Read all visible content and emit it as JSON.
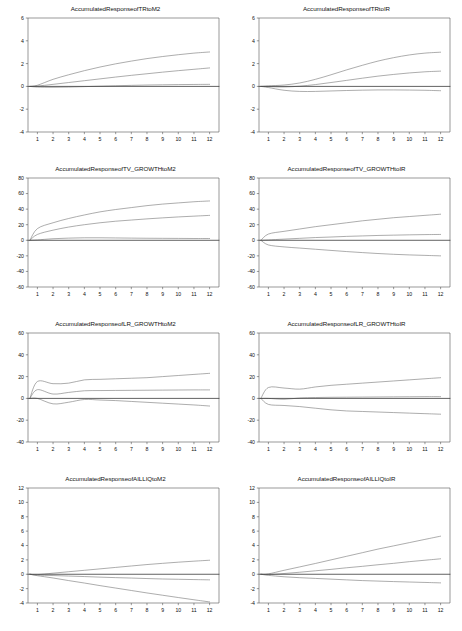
{
  "figure": {
    "type": "impulse-response-grid",
    "rows": 4,
    "cols": 2,
    "line_color": "#7a7a7a",
    "zero_line_color": "#3a3a3a",
    "axis_color": "#555555",
    "background": "#ffffff"
  },
  "chart_data": [
    {
      "type": "line",
      "title": "AccumulatedResponseofTRtoM2",
      "xlabel": "",
      "ylabel": "",
      "xlim": [
        0.4,
        12.6
      ],
      "ylim": [
        -4,
        6
      ],
      "yticks": [
        -4,
        -2,
        0,
        2,
        4,
        6
      ],
      "xticks": [
        1,
        2,
        3,
        4,
        5,
        6,
        7,
        8,
        9,
        10,
        11,
        12
      ],
      "grid": false,
      "legend": "none",
      "x": [
        1,
        2,
        3,
        4,
        5,
        6,
        7,
        8,
        9,
        10,
        11,
        12
      ],
      "series": [
        {
          "name": "upper-ci",
          "values": [
            0.1,
            0.62,
            1.02,
            1.38,
            1.7,
            1.98,
            2.22,
            2.44,
            2.62,
            2.78,
            2.92,
            3.02
          ]
        },
        {
          "name": "point-estimate",
          "values": [
            0.03,
            0.18,
            0.34,
            0.5,
            0.66,
            0.82,
            0.97,
            1.11,
            1.25,
            1.38,
            1.5,
            1.62
          ]
        },
        {
          "name": "lower-ci",
          "values": [
            -0.06,
            -0.08,
            -0.06,
            -0.02,
            0.02,
            0.06,
            0.09,
            0.12,
            0.14,
            0.16,
            0.17,
            0.18
          ]
        },
        {
          "name": "zero-line",
          "values": [
            0,
            0,
            0,
            0,
            0,
            0,
            0,
            0,
            0,
            0,
            0,
            0
          ]
        }
      ]
    },
    {
      "type": "line",
      "title": "AccumulatedResponseofTRtoIR",
      "xlabel": "",
      "ylabel": "",
      "xlim": [
        0.4,
        12.6
      ],
      "ylim": [
        -4,
        6
      ],
      "yticks": [
        -4,
        -2,
        0,
        2,
        4,
        6
      ],
      "xticks": [
        1,
        2,
        3,
        4,
        5,
        6,
        7,
        8,
        9,
        10,
        11,
        12
      ],
      "grid": false,
      "legend": "none",
      "x": [
        1,
        2,
        3,
        4,
        5,
        6,
        7,
        8,
        9,
        10,
        11,
        12
      ],
      "series": [
        {
          "name": "upper-ci",
          "values": [
            0.05,
            0.12,
            0.3,
            0.62,
            1.02,
            1.45,
            1.85,
            2.22,
            2.52,
            2.76,
            2.92,
            3.0
          ]
        },
        {
          "name": "point-estimate",
          "values": [
            -0.02,
            -0.05,
            0.02,
            0.16,
            0.34,
            0.53,
            0.72,
            0.9,
            1.05,
            1.18,
            1.28,
            1.34
          ]
        },
        {
          "name": "lower-ci",
          "values": [
            -0.1,
            -0.34,
            -0.44,
            -0.44,
            -0.4,
            -0.36,
            -0.33,
            -0.31,
            -0.31,
            -0.32,
            -0.34,
            -0.38
          ]
        },
        {
          "name": "zero-line",
          "values": [
            0,
            0,
            0,
            0,
            0,
            0,
            0,
            0,
            0,
            0,
            0,
            0
          ]
        }
      ]
    },
    {
      "type": "line",
      "title": "AccumulatedResponseofTV_GROWTHtoM2",
      "xlabel": "",
      "ylabel": "",
      "xlim": [
        0.4,
        12.6
      ],
      "ylim": [
        -60,
        80
      ],
      "yticks": [
        -60,
        -40,
        -20,
        0,
        20,
        40,
        60,
        80
      ],
      "xticks": [
        1,
        2,
        3,
        4,
        5,
        6,
        7,
        8,
        9,
        10,
        11,
        12
      ],
      "grid": false,
      "legend": "none",
      "x": [
        1,
        2,
        3,
        4,
        5,
        6,
        7,
        8,
        9,
        10,
        11,
        12
      ],
      "series": [
        {
          "name": "upper-ci",
          "values": [
            15.0,
            22.5,
            28.0,
            32.5,
            36.5,
            39.5,
            42.0,
            44.5,
            46.5,
            48.0,
            49.5,
            50.5
          ]
        },
        {
          "name": "point-estimate",
          "values": [
            7.5,
            13.0,
            17.0,
            20.0,
            22.5,
            24.5,
            26.0,
            27.5,
            28.8,
            30.0,
            31.0,
            32.0
          ]
        },
        {
          "name": "lower-ci",
          "values": [
            0.5,
            2.0,
            2.8,
            3.2,
            3.2,
            3.0,
            2.8,
            2.6,
            2.5,
            2.4,
            2.3,
            2.3
          ]
        },
        {
          "name": "zero-line",
          "values": [
            0,
            0,
            0,
            0,
            0,
            0,
            0,
            0,
            0,
            0,
            0,
            0
          ]
        }
      ]
    },
    {
      "type": "line",
      "title": "AccumulatedResponseofTV_GROWTHtoIR",
      "xlabel": "",
      "ylabel": "",
      "xlim": [
        0.4,
        12.6
      ],
      "ylim": [
        -60,
        80
      ],
      "yticks": [
        -60,
        -40,
        -20,
        0,
        20,
        40,
        60,
        80
      ],
      "xticks": [
        1,
        2,
        3,
        4,
        5,
        6,
        7,
        8,
        9,
        10,
        11,
        12
      ],
      "grid": false,
      "legend": "none",
      "x": [
        1,
        2,
        3,
        4,
        5,
        6,
        7,
        8,
        9,
        10,
        11,
        12
      ],
      "series": [
        {
          "name": "upper-ci",
          "values": [
            8.0,
            11.5,
            14.5,
            17.5,
            20.0,
            22.5,
            25.0,
            27.0,
            29.0,
            30.5,
            32.0,
            33.5
          ]
        },
        {
          "name": "point-estimate",
          "values": [
            0.5,
            1.5,
            2.5,
            3.5,
            4.2,
            5.0,
            5.6,
            6.2,
            6.6,
            7.0,
            7.3,
            7.5
          ]
        },
        {
          "name": "lower-ci",
          "values": [
            -6.0,
            -8.5,
            -10.0,
            -11.5,
            -13.0,
            -14.5,
            -15.8,
            -17.0,
            -18.0,
            -18.8,
            -19.4,
            -20.0
          ]
        },
        {
          "name": "zero-line",
          "values": [
            0,
            0,
            0,
            0,
            0,
            0,
            0,
            0,
            0,
            0,
            0,
            0
          ]
        }
      ]
    },
    {
      "type": "line",
      "title": "AccumulatedResponseofLR_GROWTHtoM2",
      "xlabel": "",
      "ylabel": "",
      "xlim": [
        0.4,
        12.6
      ],
      "ylim": [
        -40,
        60
      ],
      "yticks": [
        -40,
        -20,
        0,
        20,
        40,
        60
      ],
      "xticks": [
        1,
        2,
        3,
        4,
        5,
        6,
        7,
        8,
        9,
        10,
        11,
        12
      ],
      "grid": false,
      "legend": "none",
      "x": [
        1,
        2,
        3,
        4,
        5,
        6,
        7,
        8,
        9,
        10,
        11,
        12
      ],
      "series": [
        {
          "name": "upper-ci",
          "values": [
            15.5,
            13.5,
            14.0,
            17.0,
            17.5,
            18.0,
            18.5,
            19.0,
            20.0,
            21.0,
            22.0,
            23.0
          ]
        },
        {
          "name": "point-estimate",
          "values": [
            8.0,
            4.0,
            5.5,
            7.0,
            7.2,
            7.3,
            7.4,
            7.5,
            7.6,
            7.7,
            7.8,
            7.8
          ]
        },
        {
          "name": "lower-ci",
          "values": [
            0.0,
            -5.0,
            -3.5,
            -1.0,
            -1.5,
            -2.0,
            -2.8,
            -3.6,
            -4.4,
            -5.2,
            -6.0,
            -7.0
          ]
        },
        {
          "name": "zero-line",
          "values": [
            0,
            0,
            0,
            0,
            0,
            0,
            0,
            0,
            0,
            0,
            0,
            0
          ]
        }
      ]
    },
    {
      "type": "line",
      "title": "AccumulatedResponseofLR_GROWTHtoIR",
      "xlabel": "",
      "ylabel": "",
      "xlim": [
        0.4,
        12.6
      ],
      "ylim": [
        -40,
        60
      ],
      "yticks": [
        -40,
        -20,
        0,
        20,
        40,
        60
      ],
      "xticks": [
        1,
        2,
        3,
        4,
        5,
        6,
        7,
        8,
        9,
        10,
        11,
        12
      ],
      "grid": false,
      "legend": "none",
      "x": [
        1,
        2,
        3,
        4,
        5,
        6,
        7,
        8,
        9,
        10,
        11,
        12
      ],
      "series": [
        {
          "name": "upper-ci",
          "values": [
            10.0,
            9.5,
            8.5,
            10.5,
            12.0,
            13.0,
            14.0,
            15.0,
            16.0,
            17.0,
            18.0,
            19.0
          ]
        },
        {
          "name": "point-estimate",
          "values": [
            0.0,
            -0.8,
            0.4,
            0.8,
            1.0,
            1.1,
            1.2,
            1.3,
            1.4,
            1.5,
            1.6,
            1.6
          ]
        },
        {
          "name": "lower-ci",
          "values": [
            -5.5,
            -6.5,
            -7.5,
            -9.0,
            -10.5,
            -11.5,
            -12.0,
            -12.5,
            -13.0,
            -13.5,
            -14.0,
            -14.5
          ]
        },
        {
          "name": "zero-line",
          "values": [
            0,
            0,
            0,
            0,
            0,
            0,
            0,
            0,
            0,
            0,
            0,
            0
          ]
        }
      ]
    },
    {
      "type": "line",
      "title": "AccumulatedResponseofAILLIQtoM2",
      "xlabel": "",
      "ylabel": "",
      "xlim": [
        0.4,
        12.6
      ],
      "ylim": [
        -4,
        12
      ],
      "yticks": [
        -4,
        -2,
        0,
        2,
        4,
        6,
        8,
        10,
        12
      ],
      "xticks": [
        1,
        2,
        3,
        4,
        5,
        6,
        7,
        8,
        9,
        10,
        11,
        12
      ],
      "grid": false,
      "legend": "none",
      "x": [
        1,
        2,
        3,
        4,
        5,
        6,
        7,
        8,
        9,
        10,
        11,
        12
      ],
      "series": [
        {
          "name": "upper-ci",
          "values": [
            -0.05,
            0.15,
            0.35,
            0.55,
            0.75,
            0.95,
            1.15,
            1.35,
            1.52,
            1.68,
            1.82,
            1.95
          ]
        },
        {
          "name": "point-estimate",
          "values": [
            -0.12,
            -0.18,
            -0.25,
            -0.32,
            -0.4,
            -0.47,
            -0.53,
            -0.6,
            -0.66,
            -0.7,
            -0.74,
            -0.78
          ]
        },
        {
          "name": "lower-ci",
          "values": [
            -0.2,
            -0.52,
            -0.88,
            -1.22,
            -1.58,
            -1.92,
            -2.26,
            -2.6,
            -2.92,
            -3.24,
            -3.55,
            -3.85
          ]
        },
        {
          "name": "zero-line",
          "values": [
            0,
            0,
            0,
            0,
            0,
            0,
            0,
            0,
            0,
            0,
            0,
            0
          ]
        }
      ]
    },
    {
      "type": "line",
      "title": "AccumulatedResponseofAILLIQtoIR",
      "xlabel": "",
      "ylabel": "",
      "xlim": [
        0.4,
        12.6
      ],
      "ylim": [
        -4,
        12
      ],
      "yticks": [
        -4,
        -2,
        0,
        2,
        4,
        6,
        8,
        10,
        12
      ],
      "xticks": [
        1,
        2,
        3,
        4,
        5,
        6,
        7,
        8,
        9,
        10,
        11,
        12
      ],
      "grid": false,
      "legend": "none",
      "x": [
        1,
        2,
        3,
        4,
        5,
        6,
        7,
        8,
        9,
        10,
        11,
        12
      ],
      "series": [
        {
          "name": "upper-ci",
          "values": [
            0.05,
            0.55,
            1.02,
            1.5,
            2.0,
            2.5,
            3.0,
            3.5,
            3.95,
            4.4,
            4.85,
            5.3
          ]
        },
        {
          "name": "point-estimate",
          "values": [
            -0.05,
            0.1,
            0.28,
            0.48,
            0.68,
            0.9,
            1.1,
            1.32,
            1.52,
            1.75,
            1.95,
            2.15
          ]
        },
        {
          "name": "lower-ci",
          "values": [
            -0.15,
            -0.35,
            -0.48,
            -0.58,
            -0.68,
            -0.78,
            -0.88,
            -0.95,
            -1.02,
            -1.08,
            -1.14,
            -1.2
          ]
        },
        {
          "name": "zero-line",
          "values": [
            0,
            0,
            0,
            0,
            0,
            0,
            0,
            0,
            0,
            0,
            0,
            0
          ]
        }
      ]
    }
  ]
}
